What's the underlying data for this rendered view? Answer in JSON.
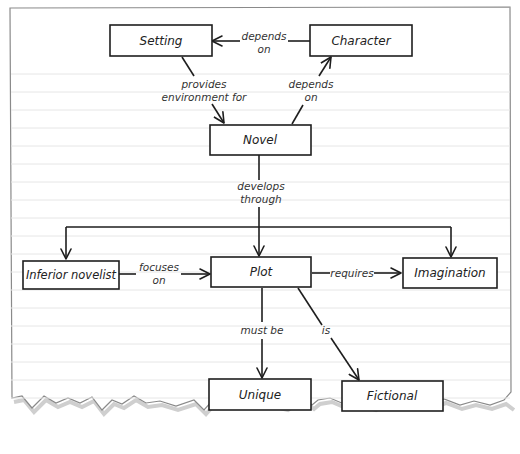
{
  "diagram": {
    "type": "concept-map",
    "nodes": [
      {
        "id": "setting",
        "label": "Setting"
      },
      {
        "id": "character",
        "label": "Character"
      },
      {
        "id": "novel",
        "label": "Novel"
      },
      {
        "id": "inferior",
        "label": "Inferior novelist"
      },
      {
        "id": "plot",
        "label": "Plot"
      },
      {
        "id": "imagination",
        "label": "Imagination"
      },
      {
        "id": "unique",
        "label": "Unique"
      },
      {
        "id": "fictional",
        "label": "Fictional"
      }
    ],
    "edges": [
      {
        "from": "character",
        "to": "setting",
        "label": [
          "depends",
          "on"
        ]
      },
      {
        "from": "setting",
        "to": "novel",
        "label": [
          "provides",
          "environment for"
        ]
      },
      {
        "from": "novel",
        "to": "character",
        "label": [
          "depends",
          "on"
        ]
      },
      {
        "from": "novel",
        "to": [
          "inferior",
          "plot",
          "imagination"
        ],
        "label": [
          "develops",
          "through"
        ]
      },
      {
        "from": "inferior",
        "to": "plot",
        "label": [
          "focuses",
          "on"
        ]
      },
      {
        "from": "plot",
        "to": "imagination",
        "label": [
          "requires"
        ]
      },
      {
        "from": "plot",
        "to": "unique",
        "label": [
          "must be"
        ]
      },
      {
        "from": "plot",
        "to": "fictional",
        "label": [
          "is"
        ]
      }
    ]
  },
  "colors": {
    "ink": "#1e1e1e",
    "paper": "#ffffff",
    "rule_line": "#e6e6e6",
    "paper_border": "#8a8a8a",
    "shadow": "#cfcfcf"
  }
}
